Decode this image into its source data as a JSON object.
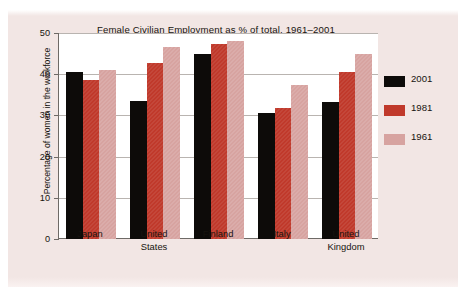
{
  "chart_data": {
    "type": "bar",
    "title": "Female Civilian Employment as % of total, 1961–2001",
    "xlabel": "",
    "ylabel": "Percentage of women in the workforce",
    "ylim": [
      0,
      50
    ],
    "yticks": [
      "0",
      "10",
      "20",
      "30",
      "40",
      "50"
    ],
    "ytick_values": [
      0,
      10,
      20,
      30,
      40,
      50
    ],
    "grid": true,
    "legend_position": "right",
    "categories": [
      "Japan",
      "United States",
      "Finland",
      "Italy",
      "United Kingdom"
    ],
    "category_lines": [
      [
        "Japan"
      ],
      [
        "United",
        "States"
      ],
      [
        "Finland"
      ],
      [
        "Italy"
      ],
      [
        "United",
        "Kingdom"
      ]
    ],
    "series": [
      {
        "name": "2001",
        "color": "#0d0b09",
        "values": [
          40.5,
          33.5,
          44.8,
          30.7,
          33.3
        ]
      },
      {
        "name": "1981",
        "color": "#c0392b",
        "values": [
          38.5,
          42.8,
          47.3,
          31.8,
          40.6
        ]
      },
      {
        "name": "1961",
        "color": "#d7a3a0",
        "values": [
          41.0,
          46.5,
          48.0,
          37.5,
          45.0
        ]
      }
    ]
  },
  "legend": {
    "entries": [
      {
        "label": "2001",
        "color": "#0d0b09"
      },
      {
        "label": "1981",
        "color": "#c0392b"
      },
      {
        "label": "1961",
        "color": "#d7a3a0"
      }
    ]
  },
  "colors": {
    "page_background": "#f2e6e4",
    "plot_background": "#ffffff",
    "axis": "#6e6a66",
    "gridline": "#b9b4b0",
    "text": "#17140f",
    "series_2001": "#0d0b09",
    "series_1981": "#c0392b",
    "series_1961": "#d7a3a0"
  }
}
